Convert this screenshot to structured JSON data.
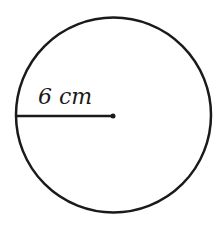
{
  "diagram": {
    "shape": "circle",
    "radius_label": "6 cm",
    "stroke_color": "#1a1a1a",
    "background": "#ffffff"
  }
}
